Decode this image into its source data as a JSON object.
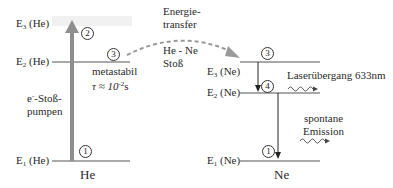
{
  "colors": {
    "level_line": "#444444",
    "pump_arrow": "#8c8c8c",
    "transfer_arrow": "#9a9a9a",
    "ne_arrow": "#333333",
    "highlight": "#eeeeee"
  },
  "he": {
    "title": "He",
    "levels": {
      "e3": {
        "label": "E",
        "sub": "3",
        "suffix": " (He)"
      },
      "e2": {
        "label": "E",
        "sub": "2",
        "suffix": " (He)"
      },
      "e1": {
        "label": "E",
        "sub": "1",
        "suffix": " (He)"
      }
    },
    "pump_label": {
      "line1": "e",
      "sup": "-",
      "line1_rest": "-Stoß-",
      "line2": "pumpen"
    },
    "metastable": {
      "line1": "metastabil",
      "tau": "τ ≈ 10",
      "exp": "-2",
      "unit": "s"
    },
    "markers": {
      "m1": "1",
      "m2": "2",
      "m3": "3"
    }
  },
  "transfer": {
    "line1": "Energie-",
    "line2": "transfer",
    "line3": "He - Ne",
    "line4": "Stoß"
  },
  "ne": {
    "title": "Ne",
    "levels": {
      "e3": {
        "label": "E",
        "sub": "3",
        "suffix": " (Ne)"
      },
      "e2": {
        "label": "E",
        "sub": "2",
        "suffix": " (Ne)"
      },
      "e1": {
        "label": "E",
        "sub": "1",
        "suffix": " (Ne)"
      }
    },
    "laser_label": "Laserübergang 633nm",
    "spontaneous": {
      "line1": "spontane",
      "line2": "Emission"
    },
    "markers": {
      "m3": "3",
      "m4": "4",
      "m1": "1"
    }
  }
}
